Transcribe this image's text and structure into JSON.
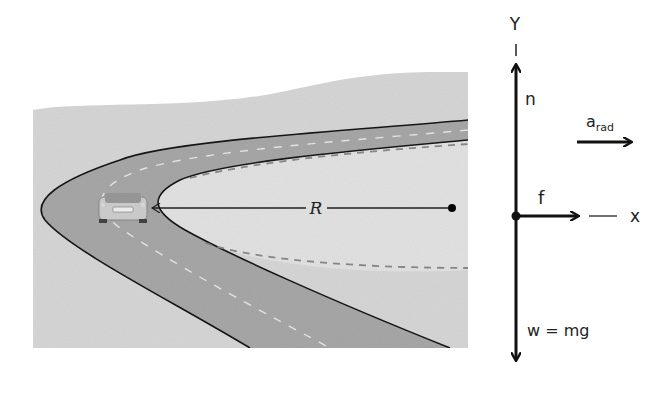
{
  "road_scene": {
    "radius_label": "R",
    "background_color": "#d9d9d9",
    "road_color": "#a6a6a6",
    "edge_color": "#1a1a1a",
    "dash_color": "#8c8c8c"
  },
  "free_body_diagram": {
    "y_axis_label": "Y",
    "x_axis_label": "x",
    "normal_force_label": "n",
    "friction_label": "f",
    "weight_label": "w = mg",
    "acceleration_label": "a",
    "acceleration_subscript": "rad",
    "vector_color": "#111111"
  }
}
